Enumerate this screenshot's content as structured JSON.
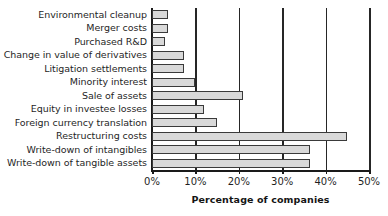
{
  "chart_data": {
    "type": "bar",
    "orientation": "horizontal",
    "title": "",
    "xlabel": "Percentage of companies",
    "ylabel": "",
    "xlim": [
      0,
      50
    ],
    "xticks": [
      0,
      10,
      20,
      30,
      40,
      50
    ],
    "xtick_labels": [
      "0%",
      "10%",
      "20%",
      "30%",
      "40%",
      "50%"
    ],
    "grid": true,
    "grid_axis": "x",
    "legend": false,
    "categories": [
      "Environmental cleanup",
      "Merger costs",
      "Purchased R&D",
      "Change in value of derivatives",
      "Litigation settlements",
      "Minority interest",
      "Sale of assets",
      "Equity in investee losses",
      "Foreign currency translation",
      "Restructuring costs",
      "Write-down of intangibles",
      "Write-down of tangible assets"
    ],
    "values": [
      3.7,
      3.7,
      3.0,
      7.4,
      7.4,
      10.0,
      21.0,
      12.0,
      15.0,
      45.0,
      36.5,
      36.5
    ],
    "bar_fill_color": "#d9d9d9",
    "bar_edge_color": "#3a3a3a",
    "axis_color": "#1a1a1a",
    "background_color": "#ffffff"
  }
}
